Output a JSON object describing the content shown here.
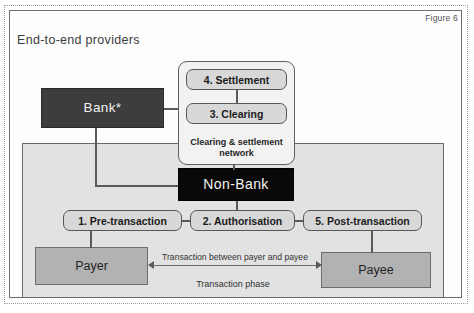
{
  "figure": {
    "label": "Figure 6",
    "title": "End-to-end providers"
  },
  "nodes": {
    "bank": "Bank*",
    "non_bank": "Non-Bank",
    "payer": "Payer",
    "payee": "Payee"
  },
  "network": {
    "settlement": "4. Settlement",
    "clearing": "3. Clearing",
    "caption": "Clearing & settlement network"
  },
  "phases": {
    "pre": "1. Pre-transaction",
    "authorisation": "2. Authorisation",
    "post": "5. Post-transaction",
    "panel_caption": "Transaction phase"
  },
  "transaction_arrow": {
    "label": "Transaction between payer and payee"
  },
  "colors": {
    "bank_fill": "#3d3d3d",
    "non_bank_fill": "#090909",
    "party_fill": "#b2b2b2",
    "panel_fill": "#e2e2e2",
    "pill_fill": "#d8d8d8",
    "network_fill": "#f2f2f2",
    "line": "#5a5a5a"
  }
}
